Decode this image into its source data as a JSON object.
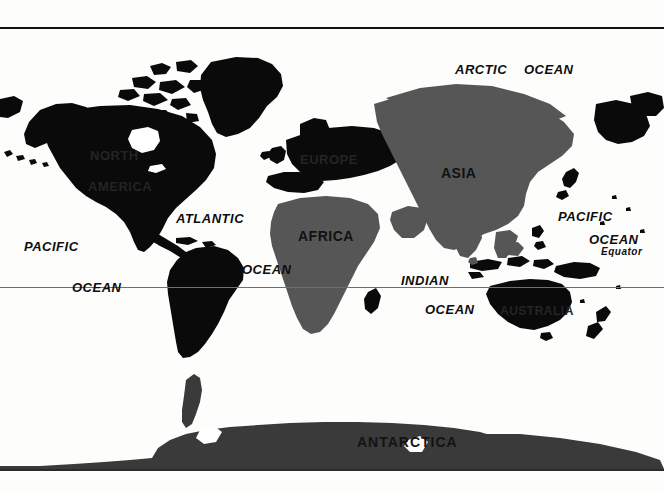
{
  "figure": {
    "kind": "world-map",
    "projection_note": "mercator-style world map",
    "background_color": "#fdfdfc",
    "frame_color": "#111111"
  },
  "palette": {
    "ocean": "#ffffff",
    "land_black": "#0a0a0a",
    "land_dark_gray": "#3a3a3a",
    "land_mid_gray": "#565656",
    "equator_line": "#6f6f6f",
    "label_on_light": "#0d0d0d",
    "label_on_dark": "#242424"
  },
  "graticule": {
    "equator": {
      "label": "Equator",
      "label_x": 601,
      "label_y": 254,
      "line_y": 258
    }
  },
  "continent_labels": [
    {
      "text": "NORTH",
      "x": 90,
      "y": 149,
      "tone": "on-black"
    },
    {
      "text": "AMERICA",
      "x": 88,
      "y": 180,
      "tone": "on-black"
    },
    {
      "text": "EUROPE",
      "x": 300,
      "y": 153,
      "tone": "on-black"
    },
    {
      "text": "ASIA",
      "x": 441,
      "y": 166,
      "tone": "on-mid"
    },
    {
      "text": "AFRICA",
      "x": 298,
      "y": 229,
      "tone": "on-mid"
    },
    {
      "text": "AUSTRALIA",
      "x": 500,
      "y": 305,
      "tone": "on-black"
    },
    {
      "text": "ANTARCTICA",
      "x": 357,
      "y": 435,
      "tone": "on-dark"
    }
  ],
  "ocean_labels": [
    {
      "text": "ARCTIC",
      "x": 455,
      "y": 63
    },
    {
      "text": "OCEAN",
      "x": 524,
      "y": 63
    },
    {
      "text": "ATLANTIC",
      "x": 176,
      "y": 212
    },
    {
      "text": "PACIFIC",
      "x": 24,
      "y": 240
    },
    {
      "text": "OCEAN",
      "x": 72,
      "y": 281
    },
    {
      "text": "OCEAN",
      "x": 242,
      "y": 263
    },
    {
      "text": "PACIFIC",
      "x": 558,
      "y": 210
    },
    {
      "text": "OCEAN",
      "x": 589,
      "y": 233
    },
    {
      "text": "INDIAN",
      "x": 401,
      "y": 274
    },
    {
      "text": "OCEAN",
      "x": 425,
      "y": 303
    }
  ]
}
